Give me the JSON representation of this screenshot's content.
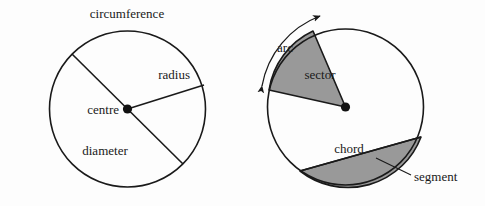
{
  "figure": {
    "background_color": "#fdfdfd",
    "stroke_color": "#1a1a1a",
    "fill_gray": "#999999",
    "text_color": "#1a1a1a"
  },
  "left_circle": {
    "name": "circle-parts-basic",
    "center": {
      "x": 127.5,
      "y": 109
    },
    "radius": 78,
    "labels": {
      "circumference": "circumference",
      "radius": "radius",
      "centre": "centre",
      "diameter": "diameter"
    }
  },
  "right_circle": {
    "name": "circle-parts-sector-segment",
    "center": {
      "x": 345.5,
      "y": 107
    },
    "radius": 78,
    "labels": {
      "arc": "arc",
      "sector": "sector",
      "chord": "chord",
      "segment": "segment"
    }
  }
}
